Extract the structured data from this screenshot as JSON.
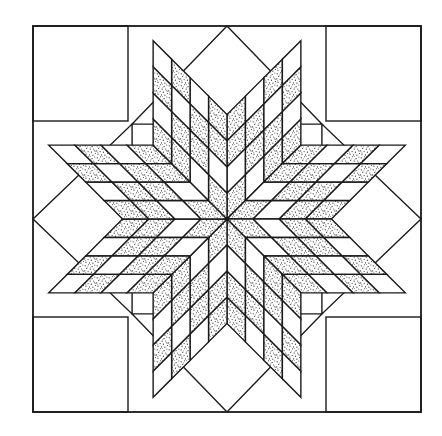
{
  "figure": {
    "subtitle": "Star of Bethlehem eight-pointed diamond star",
    "type": "line-drawing",
    "caption": ""
  },
  "canvas": {
    "width": 442,
    "height": 436,
    "background_color": "#ffffff"
  },
  "style": {
    "line_color": "#1a1a1a",
    "line_width": 1.4,
    "frame_line_width": 1.8,
    "plain_fill": "#ffffff",
    "shaded_fill": "#f2f2f2",
    "stipple_dot_color": "#262626",
    "stipple_density": "medium"
  },
  "frame": {
    "name": "block-border",
    "x": 33,
    "y": 26,
    "width": 388,
    "height": 386,
    "fill": "#ffffff"
  },
  "star": {
    "center_x": 227,
    "center_y": 219,
    "points": 8,
    "point_angles_deg": [
      270,
      315,
      0,
      45,
      90,
      135,
      180,
      225
    ],
    "diamonds_per_point": 16,
    "grid_rows": 4,
    "grid_cols": 4,
    "half_diagonal_long": 193,
    "half_diagonal_short": 95,
    "shading_rule": "diagonal bands by (row+col)",
    "shaded_bands": [
      0,
      2,
      3,
      5
    ],
    "plain_bands": [
      1,
      4,
      6
    ]
  },
  "background_pieces": {
    "corner_squares": [
      {
        "name": "corner-square-top-left",
        "x": 33,
        "y": 26,
        "size": 95
      },
      {
        "name": "corner-square-top-right",
        "x": 326,
        "y": 26,
        "size": 95
      },
      {
        "name": "corner-square-bottom-left",
        "x": 33,
        "y": 317,
        "size": 95
      },
      {
        "name": "corner-square-bottom-right",
        "x": 326,
        "y": 317,
        "size": 95
      }
    ],
    "side_triangles": [
      {
        "name": "side-triangle-top"
      },
      {
        "name": "side-triangle-right"
      },
      {
        "name": "side-triangle-bottom"
      },
      {
        "name": "side-triangle-left"
      }
    ]
  },
  "legend": {
    "shaded_label": "Stippled / printed fabric",
    "plain_label": "Plain / background fabric"
  }
}
